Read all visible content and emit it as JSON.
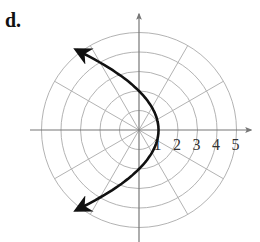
{
  "figure": {
    "label": "d.",
    "center": {
      "x": 139,
      "y": 130
    },
    "unit_px": 19.5,
    "rings": [
      1,
      2,
      3,
      4,
      5
    ],
    "spokes_deg": [
      0,
      30,
      60,
      90,
      120,
      150,
      180,
      210,
      240,
      270,
      300,
      330
    ],
    "tick_labels": [
      "1",
      "2",
      "3",
      "4",
      "5"
    ],
    "curve": {
      "equation": "r = 2/(1+cos θ)",
      "vertex_r": 1,
      "color": "#111111"
    },
    "colors": {
      "grid": "#b3b3b3",
      "axis": "#777777",
      "curve": "#111111"
    }
  }
}
